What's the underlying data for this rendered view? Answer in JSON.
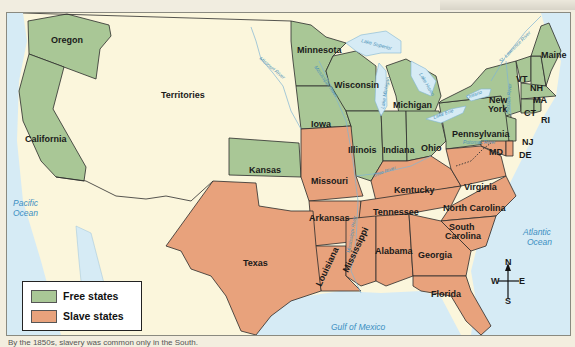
{
  "map": {
    "title": "Free and Slave States, 1850s",
    "colors": {
      "free": "#a9c796",
      "slave": "#e8a27c",
      "territory": "#fbf6dc",
      "water": "#d6ebf5",
      "border": "#2b2b2b",
      "water_label": "#3b8fc2"
    },
    "regions": {
      "territories": "Territories",
      "free_states": [
        "Oregon",
        "California",
        "Minnesota",
        "Wisconsin",
        "Michigan",
        "Iowa",
        "Illinois",
        "Indiana",
        "Ohio",
        "Kansas",
        "Pennsylvania",
        "New York",
        "Maine",
        "VT",
        "NH",
        "MA",
        "CT",
        "RI",
        "NJ"
      ],
      "slave_states": [
        "Missouri",
        "Kentucky",
        "Virginia",
        "MD",
        "DE",
        "Arkansas",
        "Tennessee",
        "North Carolina",
        "South Carolina",
        "Louisiana",
        "Mississippi",
        "Alabama",
        "Georgia",
        "Texas",
        "Florida"
      ]
    },
    "labels": {
      "oregon": "Oregon",
      "california": "California",
      "territories": "Territories",
      "minnesota": "Minnesota",
      "wisconsin": "Wisconsin",
      "michigan": "Michigan",
      "iowa": "Iowa",
      "illinois": "Illinois",
      "indiana": "Indiana",
      "ohio": "Ohio",
      "kansas": "Kansas",
      "missouri": "Missouri",
      "kentucky": "Kentucky",
      "virginia": "Virginia",
      "pennsylvania": "Pennsylvania",
      "new_york_1": "New",
      "new_york_2": "York",
      "maine": "Maine",
      "vt": "VT",
      "nh": "NH",
      "ma": "MA",
      "ct": "CT",
      "ri": "RI",
      "nj": "NJ",
      "md": "MD",
      "de": "DE",
      "arkansas": "Arkansas",
      "tennessee": "Tennessee",
      "north_carolina": "North Carolina",
      "south_carolina_1": "South",
      "south_carolina_2": "Carolina",
      "louisiana": "Louisiana",
      "mississippi": "Mississippi",
      "alabama": "Alabama",
      "georgia": "Georgia",
      "texas": "Texas",
      "florida": "Florida"
    },
    "water_labels": {
      "pacific_1": "Pacific",
      "pacific_2": "Ocean",
      "atlantic_1": "Atlantic",
      "atlantic_2": "Ocean",
      "gulf": "Gulf of Mexico",
      "lake_superior": "Lake Superior",
      "lake_michigan": "Lake Michigan",
      "lake_huron": "Lake Huron",
      "lake_erie": "Lake Erie",
      "lake_ontario": "Ontario",
      "missouri_river": "Missouri River",
      "mississippi_river": "Mississippi River",
      "ohio_river": "Ohio River",
      "potomac_river": "Potomac River",
      "hudson_river": "Hudson River",
      "st_lawrence_river": "St. Lawrence River"
    },
    "compass": {
      "n": "N",
      "s": "S",
      "e": "E",
      "w": "W"
    }
  },
  "legend": {
    "items": [
      {
        "label": "Free states",
        "color": "#a9c796"
      },
      {
        "label": "Slave states",
        "color": "#e8a27c"
      }
    ]
  },
  "caption": "By the 1850s, slavery was common only in the South."
}
